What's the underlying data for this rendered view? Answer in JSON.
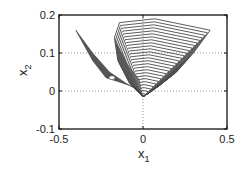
{
  "chart_data": {
    "type": "line",
    "title": "",
    "xlabel": "x",
    "xlabel_sub": "1",
    "ylabel": "x",
    "ylabel_sub": "2",
    "xlim": [
      -0.5,
      0.5
    ],
    "ylim": [
      -0.1,
      0.2
    ],
    "xticks": [
      -0.5,
      0,
      0.5
    ],
    "xtick_labels": [
      "-0.5",
      "0",
      "0.5"
    ],
    "yticks": [
      -0.1,
      0,
      0.1,
      0.2
    ],
    "ytick_labels": [
      "-0.1",
      "0",
      "0.1",
      "0.2"
    ],
    "grid": "dotted at x=0, y=0, y=0.1",
    "legend": null,
    "series": [
      {
        "name": "left leaf (filled family of trajectories)",
        "style": "filled dark gray",
        "points": [
          [
            -0.4,
            0.16
          ],
          [
            -0.3,
            0.1
          ],
          [
            -0.2,
            0.05
          ],
          [
            -0.1,
            0.02
          ],
          [
            -0.02,
            0.0
          ],
          [
            0.0,
            -0.015
          ],
          [
            -0.05,
            0.01
          ],
          [
            -0.15,
            0.025
          ],
          [
            -0.22,
            0.035
          ],
          [
            -0.3,
            0.08
          ],
          [
            -0.4,
            0.16
          ]
        ]
      },
      {
        "name": "right fan (nested level curves)",
        "style": "many nested outlined curves",
        "count": 26,
        "outer_curve": [
          [
            -0.17,
            0.14
          ],
          [
            -0.14,
            0.18
          ],
          [
            0.07,
            0.19
          ],
          [
            0.4,
            0.16
          ],
          [
            0.3,
            0.1
          ],
          [
            0.2,
            0.05
          ],
          [
            0.1,
            0.015
          ],
          [
            0.0,
            -0.015
          ],
          [
            -0.08,
            0.02
          ],
          [
            -0.15,
            0.08
          ],
          [
            -0.17,
            0.14
          ]
        ],
        "inner_curve": [
          [
            -0.03,
            0.0
          ],
          [
            0.0,
            0.005
          ],
          [
            0.03,
            0.0
          ],
          [
            0.0,
            -0.015
          ],
          [
            -0.03,
            0.0
          ]
        ]
      }
    ]
  },
  "colors": {
    "curve": "#4a4a4a",
    "fill": "#555555",
    "axis": "#111111",
    "grid": "#777777"
  }
}
